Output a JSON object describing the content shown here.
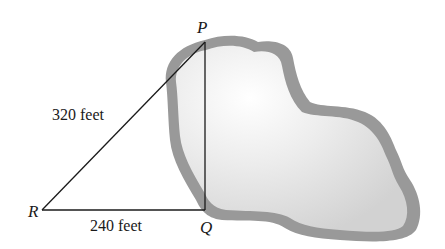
{
  "diagram": {
    "type": "right-triangle-across-pond",
    "points": {
      "P": {
        "label": "P",
        "x": 205,
        "y": 42
      },
      "Q": {
        "label": "Q",
        "x": 205,
        "y": 210
      },
      "R": {
        "label": "R",
        "x": 42,
        "y": 210
      }
    },
    "segments": [
      {
        "from": "R",
        "to": "P",
        "label": "320 feet"
      },
      {
        "from": "R",
        "to": "Q",
        "label": "240 feet"
      },
      {
        "from": "P",
        "to": "Q",
        "label": ""
      }
    ],
    "region": {
      "name": "pond",
      "fill_light": "#f8f8f8",
      "fill_dark": "#d8d8d8",
      "border": "#9a9a9a"
    },
    "line_color": "#1a1a1a"
  }
}
